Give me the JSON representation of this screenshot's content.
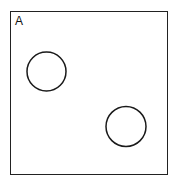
{
  "panel": {
    "label": "A",
    "border_color": "#222222"
  },
  "circles": [
    {
      "name": "circle-upper-left",
      "cx": 46.5,
      "cy": 71.5,
      "r": 19.5
    },
    {
      "name": "circle-lower-right",
      "cx": 126,
      "cy": 126.5,
      "r": 20
    }
  ],
  "stroke_color": "#1a1a1a"
}
